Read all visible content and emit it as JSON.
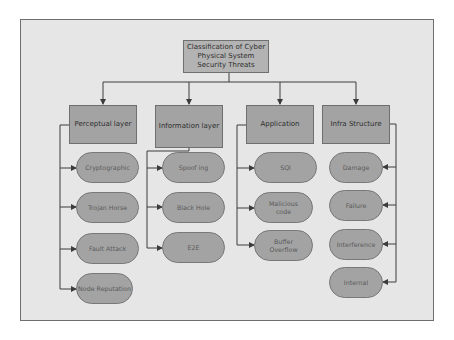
{
  "diagram": {
    "root": {
      "label": "Classification of Cyber Physical System Security Threats",
      "lines": [
        "Classification of Cyber",
        "Physical System",
        "Security Threats"
      ]
    },
    "categories": [
      {
        "label": "Perceptual layer",
        "children": [
          {
            "label": "Cryptographic"
          },
          {
            "label": "Trojan Horse"
          },
          {
            "label": "Fault Attack"
          },
          {
            "label": "Node Reputation"
          }
        ]
      },
      {
        "label": "Information layer",
        "children": [
          {
            "label": "Spoof ing"
          },
          {
            "label": "Black Hole"
          },
          {
            "label": "E2E"
          }
        ]
      },
      {
        "label": "Application",
        "children": [
          {
            "label": "SQl"
          },
          {
            "label": "Malicious code"
          },
          {
            "label": "Buffer Overflow"
          }
        ]
      },
      {
        "label": "Infra Structure",
        "children": [
          {
            "label": "Damage"
          },
          {
            "label": "Failure"
          },
          {
            "label": "Interference"
          },
          {
            "label": "Internal"
          }
        ]
      }
    ]
  },
  "colors": {
    "background": "#e6e6e6",
    "box_fill": "#a3a3a3",
    "root_fill": "#b3b3b3",
    "connector": "#3c3c3c"
  }
}
